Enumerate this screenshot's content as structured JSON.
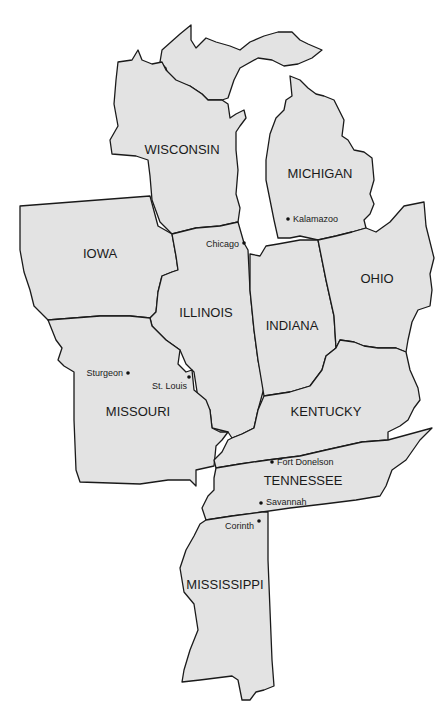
{
  "map": {
    "colors": {
      "land": "#e3e3e3",
      "border": "#1a1a1a",
      "water": "#ffffff",
      "text": "#1a1a1a"
    },
    "states": [
      {
        "id": "wisconsin",
        "label": "WISCONSIN",
        "x": 182,
        "y": 154
      },
      {
        "id": "michigan",
        "label": "MICHIGAN",
        "x": 320,
        "y": 178
      },
      {
        "id": "iowa",
        "label": "IOWA",
        "x": 100,
        "y": 258
      },
      {
        "id": "illinois",
        "label": "ILLINOIS",
        "x": 206,
        "y": 317
      },
      {
        "id": "indiana",
        "label": "INDIANA",
        "x": 292,
        "y": 330
      },
      {
        "id": "ohio",
        "label": "OHIO",
        "x": 377,
        "y": 283
      },
      {
        "id": "missouri",
        "label": "MISSOURI",
        "x": 138,
        "y": 416
      },
      {
        "id": "kentucky",
        "label": "KENTUCKY",
        "x": 326,
        "y": 416
      },
      {
        "id": "tennessee",
        "label": "TENNESSEE",
        "x": 303,
        "y": 485
      },
      {
        "id": "mississippi",
        "label": "MISSISSIPPI",
        "x": 225,
        "y": 589
      }
    ],
    "cities": [
      {
        "id": "kalamazoo",
        "label": "Kalamazoo",
        "dot_x": 288,
        "dot_y": 219,
        "label_x": 293,
        "label_y": 222,
        "anchor": "start"
      },
      {
        "id": "chicago",
        "label": "Chicago",
        "dot_x": 244,
        "dot_y": 243,
        "label_x": 239,
        "label_y": 247,
        "anchor": "end"
      },
      {
        "id": "sturgeon",
        "label": "Sturgeon",
        "dot_x": 128,
        "dot_y": 373,
        "label_x": 123,
        "label_y": 376,
        "anchor": "end"
      },
      {
        "id": "st-louis",
        "label": "St. Louis",
        "dot_x": 189,
        "dot_y": 377,
        "label_x": 152,
        "label_y": 389,
        "anchor": "start"
      },
      {
        "id": "fort-donelson",
        "label": "Fort Donelson",
        "dot_x": 272,
        "dot_y": 462,
        "label_x": 277,
        "label_y": 465,
        "anchor": "start"
      },
      {
        "id": "savannah",
        "label": "Savannah",
        "dot_x": 261,
        "dot_y": 503,
        "label_x": 266,
        "label_y": 505,
        "anchor": "start"
      },
      {
        "id": "corinth",
        "label": "Corinth",
        "dot_x": 259,
        "dot_y": 521,
        "label_x": 254,
        "label_y": 529,
        "anchor": "end"
      }
    ]
  }
}
